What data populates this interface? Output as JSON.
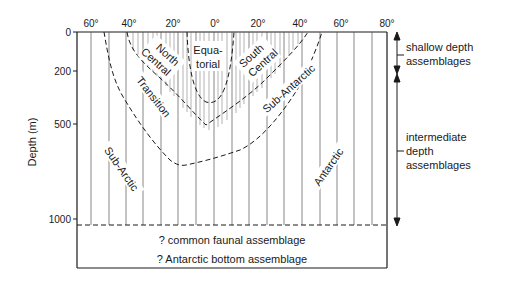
{
  "diagram": {
    "y_axis": {
      "title": "Depth (m)",
      "ticks": [
        {
          "label": "0",
          "y": 32
        },
        {
          "label": "200",
          "y": 71
        },
        {
          "label": "500",
          "y": 124
        },
        {
          "label": "1000",
          "y": 219
        }
      ]
    },
    "x_axis": {
      "ticks": [
        {
          "label": "60°",
          "x": 91
        },
        {
          "label": "40°",
          "x": 129
        },
        {
          "label": "20°",
          "x": 173
        },
        {
          "label": "0°",
          "x": 215
        },
        {
          "label": "20°",
          "x": 258
        },
        {
          "label": "40°",
          "x": 300
        },
        {
          "label": "60°",
          "x": 341
        },
        {
          "label": "80°",
          "x": 387
        }
      ]
    },
    "zones": {
      "equatorial_line1": "Equa-",
      "equatorial_line2": "torial",
      "north_central_line1": "North",
      "north_central_line2": "Central",
      "south_central_line1": "South",
      "south_central_line2": "Central",
      "transition": "Transition",
      "sub_antarctic": "Sub-Antarctic",
      "sub_arctic": "Sub-Arctic",
      "antarctic": "Antarctic"
    },
    "bottom": {
      "line1": "? common faunal assemblage",
      "line2": "? Antarctic bottom assemblage"
    },
    "right_annotations": {
      "shallow_line1": "shallow depth",
      "shallow_line2": "assemblages",
      "intermediate_line1": "intermediate",
      "intermediate_line2": "depth",
      "intermediate_line3": "assemblages"
    }
  }
}
